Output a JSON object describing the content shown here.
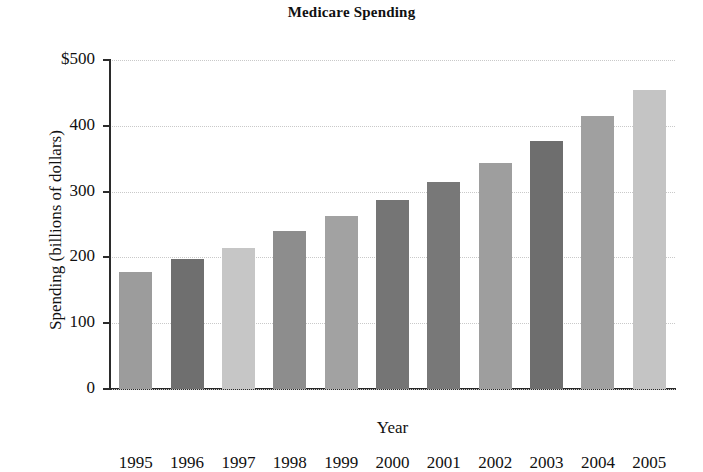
{
  "chart_data": {
    "type": "bar",
    "title": "Medicare Spending",
    "xlabel": "Year",
    "ylabel": "Spending (billions of dollars)",
    "categories": [
      "1995",
      "1996",
      "1997",
      "1998",
      "1999",
      "2000",
      "2001",
      "2002",
      "2003",
      "2004",
      "2005"
    ],
    "values": [
      178,
      198,
      215,
      240,
      263,
      288,
      315,
      344,
      377,
      415,
      455
    ],
    "bar_colors": [
      "#9c9c9c",
      "#6f6f6f",
      "#c6c6c6",
      "#8d8d8d",
      "#a2a2a2",
      "#757575",
      "#787878",
      "#9e9e9e",
      "#6e6e6e",
      "#a0a0a0",
      "#c4c4c4"
    ],
    "ylim": [
      0,
      500
    ],
    "yticks": [
      0,
      100,
      200,
      300,
      400,
      500
    ],
    "ytick_labels": [
      "0",
      "100",
      "200",
      "300",
      "400",
      "$500"
    ],
    "grid": true,
    "legend": "none",
    "axis_color": "#2b2b2b",
    "grid_color": "#c9c9c9",
    "background": "#ffffff"
  }
}
